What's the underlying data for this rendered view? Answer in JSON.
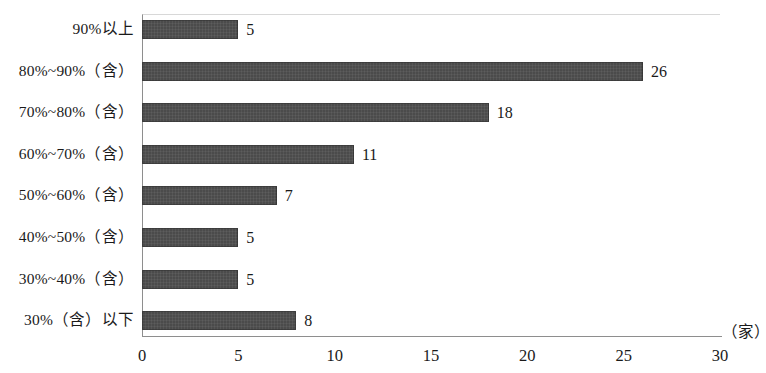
{
  "chart_data": {
    "type": "bar",
    "orientation": "horizontal",
    "title": "",
    "subtitle": "",
    "xlabel": "（家）",
    "ylabel": "",
    "categories": [
      "90%以上",
      "80%~90%（含）",
      "70%~80%（含）",
      "60%~70%（含）",
      "50%~60%（含）",
      "40%~50%（含）",
      "30%~40%（含）",
      "30%（含）以下"
    ],
    "values": [
      5,
      26,
      18,
      11,
      7,
      5,
      5,
      8
    ],
    "value_labels": [
      "5",
      "26",
      "18",
      "11",
      "7",
      "5",
      "5",
      "8"
    ],
    "xlim": [
      0,
      30
    ],
    "xticks": [
      0,
      5,
      10,
      15,
      20,
      25,
      30
    ],
    "xtick_labels": [
      "0",
      "5",
      "10",
      "15",
      "20",
      "25",
      "30"
    ],
    "grid": false,
    "legend": null,
    "bar_color": "#4b4b4b",
    "axis_color": "#8e8e8e",
    "background_color": "#ffffff"
  }
}
